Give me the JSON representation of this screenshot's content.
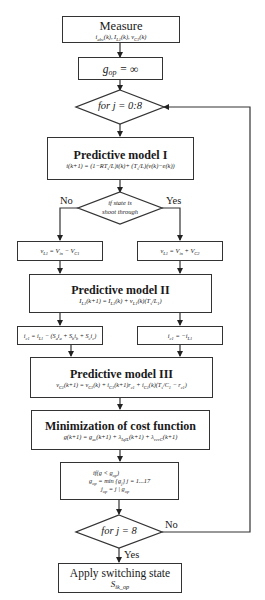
{
  "flowchart": {
    "measure": {
      "title": "Measure",
      "equation": "i_abc(k), I_L1(k), v_C1(k)"
    },
    "init": {
      "equation": "g_op = ∞"
    },
    "loop_start": {
      "label": "for j = 0:8"
    },
    "model1": {
      "title": "Predictive model I",
      "equation": "i(k+1) = (1−RT_s/L)i(k) + (T_s/L)(v(k)−e(k))"
    },
    "shoot_through": {
      "label_line1": "if state is",
      "label_line2": "shoot through",
      "no_label": "No",
      "yes_label": "Yes"
    },
    "vl_no": {
      "equation": "v_L1 = V_in − V_C1"
    },
    "vl_yes": {
      "equation": "v_L1 = V_in + V_C2"
    },
    "model2": {
      "title": "Predictive model II",
      "equation": "I_L1(k+1) = I_L1(k) + v_L1(k)(T_s/L_1)"
    },
    "ic_no": {
      "equation": "i_c1 = i_L1 − (S_a i_a + S_b i_b + S_c i_c)"
    },
    "ic_yes": {
      "equation": "i_c1 = −i_L1"
    },
    "model3": {
      "title": "Predictive model III",
      "equation": "v_C1(k+1) = v_C1(k) + i_C1(k+1)r_c1 + i_C1(k)(T_s/C_1 − r_c1)"
    },
    "cost": {
      "title": "Minimization of cost function",
      "equation": "g(k+1) = g_ac(k+1) + λ_IqIL(k+1) + λ_vcvC(k+1)"
    },
    "select": {
      "line1": "if(g < g_op)",
      "line2": "g_op = min {g_j} j = 1...17",
      "line3": "j_op = j | g_op"
    },
    "loop_end": {
      "label": "for j = 8",
      "no_label": "No",
      "yes_label": "Yes"
    },
    "apply": {
      "title": "Apply switching state",
      "equation": "S_ik_op"
    }
  },
  "colors": {
    "line": "#333333",
    "background": "#ffffff",
    "text": "#1a1a1a"
  }
}
